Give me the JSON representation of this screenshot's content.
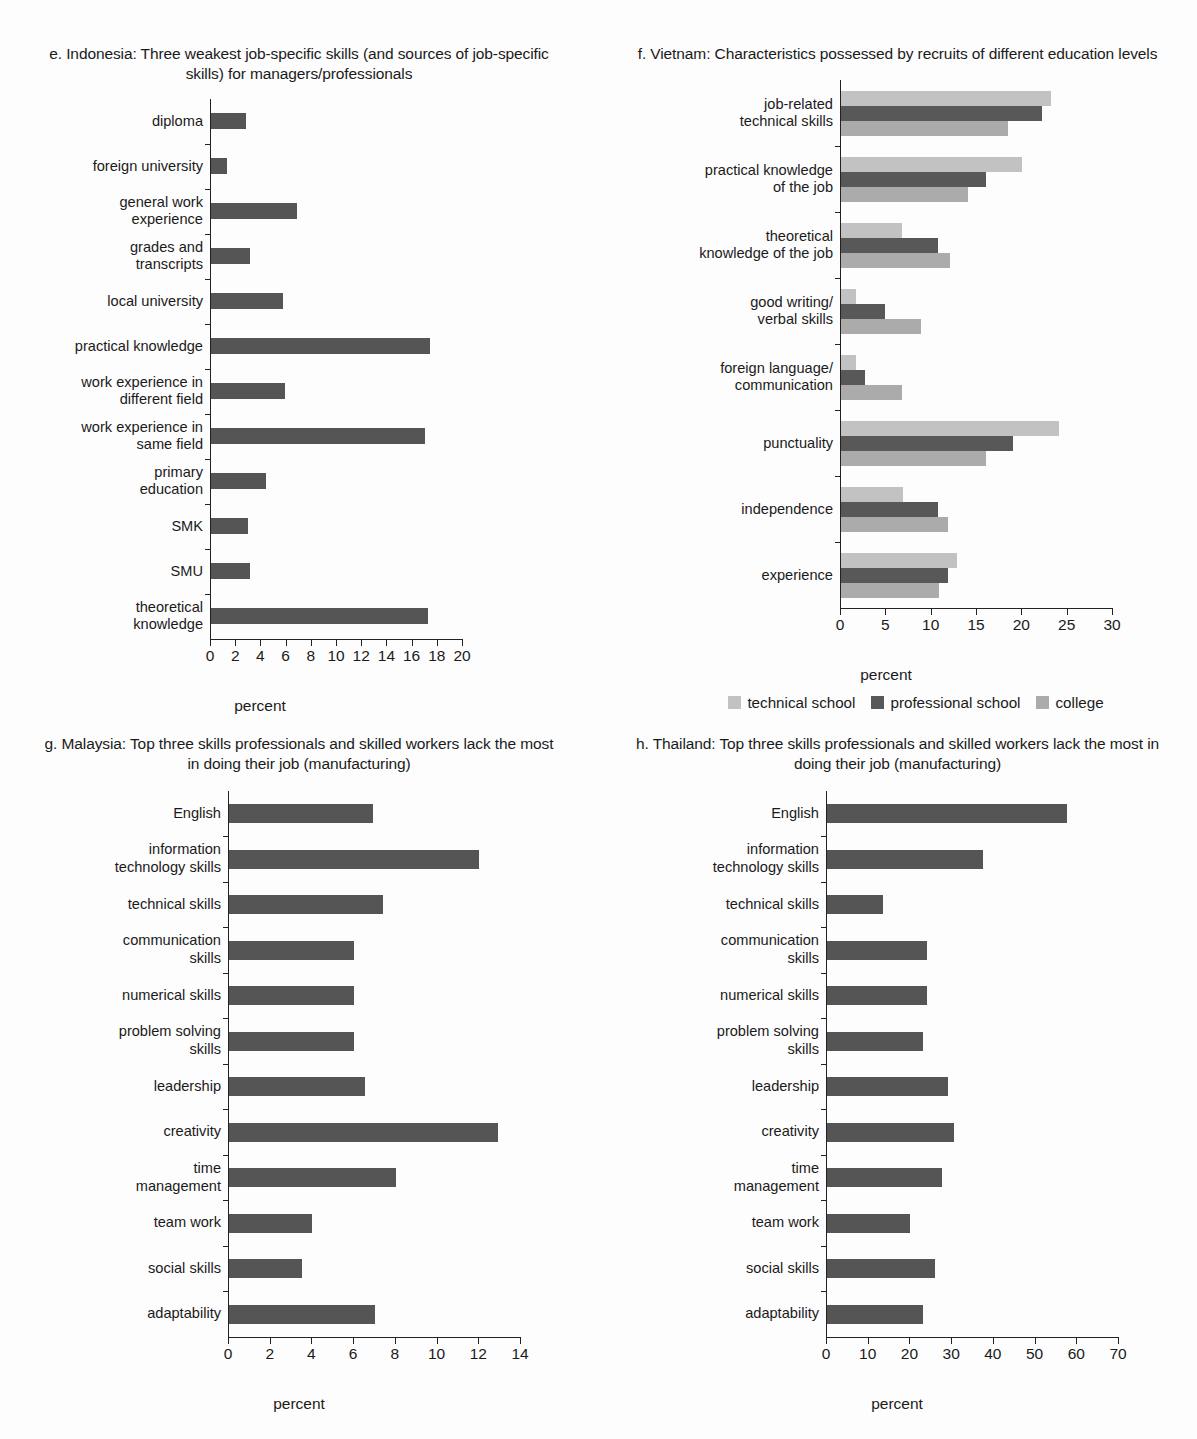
{
  "colors": {
    "bar_dark": "#555555",
    "technical_school": "#c2c2c2",
    "professional_school": "#585858",
    "college": "#ababab",
    "axis": "#222222",
    "background": "#fdfdfd"
  },
  "panels": [
    {
      "id": "e",
      "title": "e. Indonesia: Three weakest job-specific skills (and\nsources of job-specific skills) for managers/professionals",
      "xlabel": "percent"
    },
    {
      "id": "f",
      "title": "f. Vietnam: Characteristics possessed by\nrecruits of different education levels",
      "xlabel": "percent"
    },
    {
      "id": "g",
      "title": "g. Malaysia: Top three skills professionals and skilled\nworkers lack the most in doing their job (manufacturing)",
      "xlabel": "percent"
    },
    {
      "id": "h",
      "title": "h. Thailand: Top three skills professionals and skilled\nworkers lack the most in doing their job (manufacturing)",
      "xlabel": "percent"
    }
  ],
  "legend": {
    "items": [
      {
        "label": "technical school",
        "color": "#c2c2c2"
      },
      {
        "label": "professional school",
        "color": "#585858"
      },
      {
        "label": "college",
        "color": "#ababab"
      }
    ]
  },
  "chart_data": [
    {
      "id": "e",
      "type": "bar",
      "orientation": "horizontal",
      "title": "e. Indonesia: Three weakest job-specific skills (and sources of job-specific skills) for managers/professionals",
      "xlabel": "percent",
      "ylabel": "",
      "xlim": [
        0,
        20
      ],
      "xticks": [
        0,
        2,
        4,
        6,
        8,
        10,
        12,
        14,
        16,
        18,
        20
      ],
      "grid": false,
      "legend": "none",
      "categories": [
        "diploma",
        "foreign university",
        "general work\nexperience",
        "grades and\ntranscripts",
        "local university",
        "practical knowledge",
        "work experience in\ndifferent field",
        "work experience in\nsame field",
        "primary\neducation",
        "SMK",
        "SMU",
        "theoretical\nknowledge"
      ],
      "values": [
        2.8,
        1.3,
        6.8,
        3.1,
        5.7,
        17.4,
        5.9,
        17.0,
        4.4,
        2.9,
        3.1,
        17.2
      ]
    },
    {
      "id": "f",
      "type": "bar",
      "orientation": "horizontal",
      "grouped": true,
      "title": "f. Vietnam: Characteristics possessed by recruits of different education levels",
      "xlabel": "percent",
      "ylabel": "",
      "xlim": [
        0,
        30
      ],
      "xticks": [
        0,
        5,
        10,
        15,
        20,
        25,
        30
      ],
      "grid": false,
      "legend": "bottom",
      "categories": [
        "job-related\ntechnical skills",
        "practical knowledge\nof the job",
        "theoretical\nknowledge of the job",
        "good writing/\nverbal skills",
        "foreign language/\ncommunication",
        "punctuality",
        "independence",
        "experience"
      ],
      "series": [
        {
          "name": "technical school",
          "color": "#c2c2c2",
          "values": [
            23.2,
            20.0,
            6.7,
            1.7,
            1.6,
            24.0,
            6.8,
            12.8
          ]
        },
        {
          "name": "professional school",
          "color": "#585858",
          "values": [
            22.2,
            16.0,
            10.7,
            4.8,
            2.6,
            19.0,
            10.7,
            11.8
          ]
        },
        {
          "name": "college",
          "color": "#ababab",
          "values": [
            18.4,
            14.0,
            12.0,
            8.8,
            6.7,
            16.0,
            11.8,
            10.8
          ]
        }
      ]
    },
    {
      "id": "g",
      "type": "bar",
      "orientation": "horizontal",
      "title": "g. Malaysia: Top three skills professionals and skilled workers lack the most in doing their job (manufacturing)",
      "xlabel": "percent",
      "ylabel": "",
      "xlim": [
        0,
        14
      ],
      "xticks": [
        0,
        2,
        4,
        6,
        8,
        10,
        12,
        14
      ],
      "grid": false,
      "legend": "none",
      "categories": [
        "English",
        "information\ntechnology skills",
        "technical skills",
        "communication\nskills",
        "numerical skills",
        "problem solving\nskills",
        "leadership",
        "creativity",
        "time\nmanagement",
        "team work",
        "social skills",
        "adaptability"
      ],
      "values": [
        6.9,
        12.0,
        7.4,
        6.0,
        6.0,
        6.0,
        6.5,
        12.9,
        8.0,
        4.0,
        3.5,
        7.0
      ]
    },
    {
      "id": "h",
      "type": "bar",
      "orientation": "horizontal",
      "title": "h. Thailand: Top three skills professionals and skilled workers lack the most in doing their job (manufacturing)",
      "xlabel": "percent",
      "ylabel": "",
      "xlim": [
        0,
        70
      ],
      "xticks": [
        0,
        10,
        20,
        30,
        40,
        50,
        60,
        70
      ],
      "grid": false,
      "legend": "none",
      "categories": [
        "English",
        "information\ntechnology skills",
        "technical skills",
        "communication\nskills",
        "numerical skills",
        "problem solving\nskills",
        "leadership",
        "creativity",
        "time\nmanagement",
        "team work",
        "social skills",
        "adaptability"
      ],
      "values": [
        57.5,
        37.5,
        13.5,
        24.0,
        24.0,
        23.0,
        29.0,
        30.5,
        27.5,
        20.0,
        26.0,
        23.0
      ]
    }
  ]
}
